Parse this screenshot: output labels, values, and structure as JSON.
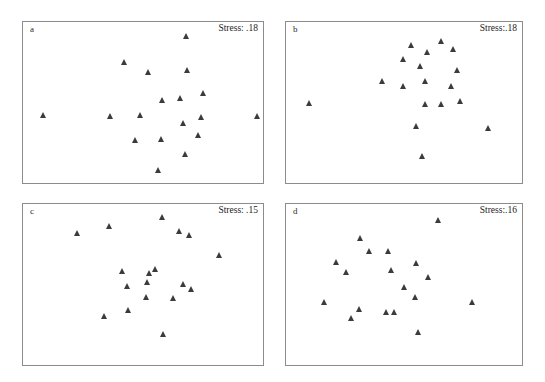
{
  "figure": {
    "width": 545,
    "height": 382,
    "background": "#ffffff",
    "marker_color": "#3b3b3b",
    "frame_color": "#8c8c8c",
    "marker_shape": "filled-triangle-up"
  },
  "panels": [
    {
      "id": "a",
      "letter": "a",
      "stress_label": "Stress: .18",
      "stress_value": 0.18,
      "frame": {
        "x": 22,
        "y": 21,
        "width": 242,
        "height": 163
      },
      "points": [
        {
          "x": 0.672,
          "y": 0.086
        },
        {
          "x": 0.419,
          "y": 0.243
        },
        {
          "x": 0.516,
          "y": 0.306
        },
        {
          "x": 0.677,
          "y": 0.293
        },
        {
          "x": 0.745,
          "y": 0.433
        },
        {
          "x": 0.575,
          "y": 0.477
        },
        {
          "x": 0.65,
          "y": 0.465
        },
        {
          "x": 0.082,
          "y": 0.573
        },
        {
          "x": 0.36,
          "y": 0.576
        },
        {
          "x": 0.483,
          "y": 0.571
        },
        {
          "x": 0.66,
          "y": 0.62
        },
        {
          "x": 0.737,
          "y": 0.582
        },
        {
          "x": 0.723,
          "y": 0.696
        },
        {
          "x": 0.462,
          "y": 0.723
        },
        {
          "x": 0.572,
          "y": 0.718
        },
        {
          "x": 0.668,
          "y": 0.809
        },
        {
          "x": 0.556,
          "y": 0.91
        },
        {
          "x": 0.967,
          "y": 0.576
        }
      ]
    },
    {
      "id": "b",
      "letter": "b",
      "stress_label": "Stress:.18",
      "stress_value": 0.18,
      "frame": {
        "x": 285,
        "y": 21,
        "width": 238,
        "height": 163
      },
      "points": [
        {
          "x": 0.525,
          "y": 0.14
        },
        {
          "x": 0.65,
          "y": 0.116
        },
        {
          "x": 0.592,
          "y": 0.183
        },
        {
          "x": 0.7,
          "y": 0.165
        },
        {
          "x": 0.49,
          "y": 0.225
        },
        {
          "x": 0.562,
          "y": 0.27
        },
        {
          "x": 0.718,
          "y": 0.296
        },
        {
          "x": 0.405,
          "y": 0.365
        },
        {
          "x": 0.585,
          "y": 0.36
        },
        {
          "x": 0.492,
          "y": 0.392
        },
        {
          "x": 0.692,
          "y": 0.392
        },
        {
          "x": 0.098,
          "y": 0.497
        },
        {
          "x": 0.585,
          "y": 0.5
        },
        {
          "x": 0.652,
          "y": 0.5
        },
        {
          "x": 0.733,
          "y": 0.487
        },
        {
          "x": 0.548,
          "y": 0.64
        },
        {
          "x": 0.848,
          "y": 0.652
        },
        {
          "x": 0.573,
          "y": 0.82
        }
      ]
    },
    {
      "id": "c",
      "letter": "c",
      "stress_label": "Stress: .15",
      "stress_value": 0.15,
      "frame": {
        "x": 22,
        "y": 203,
        "width": 242,
        "height": 163
      },
      "points": [
        {
          "x": 0.573,
          "y": 0.082
        },
        {
          "x": 0.355,
          "y": 0.136
        },
        {
          "x": 0.222,
          "y": 0.177
        },
        {
          "x": 0.645,
          "y": 0.163
        },
        {
          "x": 0.685,
          "y": 0.19
        },
        {
          "x": 0.81,
          "y": 0.31
        },
        {
          "x": 0.41,
          "y": 0.41
        },
        {
          "x": 0.522,
          "y": 0.425
        },
        {
          "x": 0.545,
          "y": 0.397
        },
        {
          "x": 0.513,
          "y": 0.48
        },
        {
          "x": 0.428,
          "y": 0.5
        },
        {
          "x": 0.66,
          "y": 0.493
        },
        {
          "x": 0.693,
          "y": 0.52
        },
        {
          "x": 0.51,
          "y": 0.568
        },
        {
          "x": 0.618,
          "y": 0.575
        },
        {
          "x": 0.435,
          "y": 0.648
        },
        {
          "x": 0.333,
          "y": 0.69
        },
        {
          "x": 0.577,
          "y": 0.795
        }
      ]
    },
    {
      "id": "d",
      "letter": "d",
      "stress_label": "Stress:.16",
      "stress_value": 0.16,
      "frame": {
        "x": 285,
        "y": 203,
        "width": 238,
        "height": 163
      },
      "points": [
        {
          "x": 0.638,
          "y": 0.098
        },
        {
          "x": 0.313,
          "y": 0.207
        },
        {
          "x": 0.35,
          "y": 0.29
        },
        {
          "x": 0.428,
          "y": 0.287
        },
        {
          "x": 0.21,
          "y": 0.358
        },
        {
          "x": 0.548,
          "y": 0.363
        },
        {
          "x": 0.443,
          "y": 0.403
        },
        {
          "x": 0.253,
          "y": 0.42
        },
        {
          "x": 0.597,
          "y": 0.45
        },
        {
          "x": 0.497,
          "y": 0.51
        },
        {
          "x": 0.54,
          "y": 0.568
        },
        {
          "x": 0.158,
          "y": 0.6
        },
        {
          "x": 0.782,
          "y": 0.602
        },
        {
          "x": 0.305,
          "y": 0.643
        },
        {
          "x": 0.42,
          "y": 0.66
        },
        {
          "x": 0.453,
          "y": 0.665
        },
        {
          "x": 0.272,
          "y": 0.7
        },
        {
          "x": 0.553,
          "y": 0.783
        }
      ]
    }
  ]
}
